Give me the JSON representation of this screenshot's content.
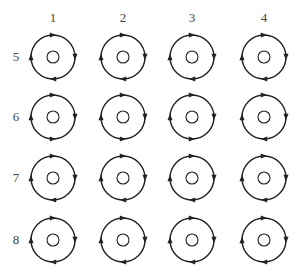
{
  "diagram": {
    "columns": [
      {
        "label": "1",
        "x": 53
      },
      {
        "label": "2",
        "x": 123
      },
      {
        "label": "3",
        "x": 192
      },
      {
        "label": "4",
        "x": 264
      }
    ],
    "rows": [
      {
        "label": "5",
        "y": 57
      },
      {
        "label": "6",
        "y": 117
      },
      {
        "label": "7",
        "y": 178
      },
      {
        "label": "8",
        "y": 240
      }
    ],
    "outer_radius": 22,
    "inner_radius": 6,
    "stroke_color": "#222222",
    "cells": [
      {
        "row": 0,
        "col": 0,
        "arrows": {
          "top": "right",
          "right": "down",
          "bottom": "left",
          "left": "up"
        }
      },
      {
        "row": 0,
        "col": 1,
        "arrows": {
          "top": "right",
          "right": "down",
          "bottom": "left",
          "left": "up"
        }
      },
      {
        "row": 0,
        "col": 2,
        "arrows": {
          "top": "right",
          "right": "down",
          "bottom": "left",
          "left": "up"
        }
      },
      {
        "row": 0,
        "col": 3,
        "arrows": {
          "top": "right",
          "right": "down",
          "bottom": "left",
          "left": "up"
        }
      },
      {
        "row": 1,
        "col": 0,
        "arrows": {
          "top": "right",
          "right": "down",
          "bottom": "right",
          "left": "up"
        }
      },
      {
        "row": 1,
        "col": 1,
        "arrows": {
          "top": "right",
          "right": "down",
          "bottom": "right",
          "left": "up"
        }
      },
      {
        "row": 1,
        "col": 2,
        "arrows": {
          "top": "right",
          "right": "down",
          "bottom": "right",
          "left": "up"
        }
      },
      {
        "row": 1,
        "col": 3,
        "arrows": {
          "top": "right",
          "right": "down",
          "bottom": "left",
          "left": "up"
        }
      },
      {
        "row": 2,
        "col": 0,
        "arrows": {
          "top": "right",
          "right": "down",
          "bottom": "left",
          "left": "up"
        }
      },
      {
        "row": 2,
        "col": 1,
        "arrows": {
          "top": "right",
          "right": "down",
          "bottom": "left",
          "left": "up"
        }
      },
      {
        "row": 2,
        "col": 2,
        "arrows": {
          "top": "right",
          "right": "down",
          "bottom": "left",
          "left": "up"
        }
      },
      {
        "row": 2,
        "col": 3,
        "arrows": {
          "top": "right",
          "right": "down",
          "bottom": "left",
          "left": "up"
        }
      },
      {
        "row": 3,
        "col": 0,
        "arrows": {
          "top": "right",
          "right": "down",
          "bottom": "left",
          "left": "up"
        }
      },
      {
        "row": 3,
        "col": 1,
        "arrows": {
          "top": "right",
          "right": "down",
          "bottom": "left",
          "left": "up"
        }
      },
      {
        "row": 3,
        "col": 2,
        "arrows": {
          "top": "right",
          "right": "down",
          "bottom": "left",
          "left": "up"
        }
      },
      {
        "row": 3,
        "col": 3,
        "arrows": {
          "top": "right",
          "right": "down",
          "bottom": "left",
          "left": "up"
        }
      }
    ]
  }
}
